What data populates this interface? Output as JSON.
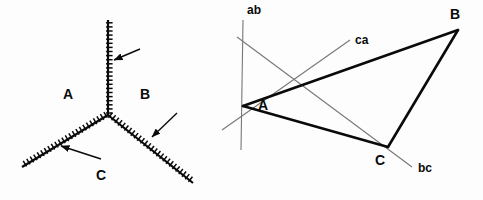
{
  "figure": {
    "background_color": "#fdfdfd",
    "ink_color": "#0a0a0a",
    "thin_line_color": "#777777",
    "width": 483,
    "height": 200
  },
  "left_panel": {
    "name": "triple-junction-grain-boundary-diagram",
    "junction": {
      "x": 108,
      "y": 115
    },
    "branches": [
      {
        "id": "branch-up",
        "label": "boundary-A-B",
        "x1": 108,
        "y1": 115,
        "x2": 108,
        "y2": 20,
        "hatch_side": 1
      },
      {
        "id": "branch-lower-left",
        "label": "boundary-A-C",
        "x1": 108,
        "y1": 115,
        "x2": 22,
        "y2": 167,
        "hatch_side": 1
      },
      {
        "id": "branch-lower-right",
        "label": "boundary-B-C",
        "x1": 108,
        "y1": 115,
        "x2": 193,
        "y2": 183,
        "hatch_side": -1
      }
    ],
    "arrows": [
      {
        "id": "arrow-to-branch-up",
        "x1": 140,
        "y1": 49,
        "x2": 114,
        "y2": 60
      },
      {
        "id": "arrow-to-branch-lower-right",
        "x1": 177,
        "y1": 113,
        "x2": 152,
        "y2": 137
      },
      {
        "id": "arrow-to-branch-lower-left",
        "x1": 101,
        "y1": 159,
        "x2": 61,
        "y2": 146
      }
    ],
    "region_labels": [
      {
        "id": "region-a",
        "text": "A",
        "x": 63,
        "y": 87
      },
      {
        "id": "region-b",
        "text": "B",
        "x": 140,
        "y": 87
      },
      {
        "id": "region-c",
        "text": "C",
        "x": 96,
        "y": 168
      }
    ]
  },
  "right_panel": {
    "name": "triangle-with-boundary-trace-lines-diagram",
    "vertices": [
      {
        "id": "vertex-a",
        "text": "A",
        "x": 243,
        "y": 106,
        "label_x": 258,
        "label_y": 98
      },
      {
        "id": "vertex-b",
        "text": "B",
        "x": 458,
        "y": 30,
        "label_x": 450,
        "label_y": 7
      },
      {
        "id": "vertex-c",
        "text": "C",
        "x": 388,
        "y": 147,
        "label_x": 375,
        "label_y": 153
      }
    ],
    "triangle_edges": [
      {
        "id": "edge-ab",
        "from": "A",
        "to": "B"
      },
      {
        "id": "edge-bc",
        "from": "B",
        "to": "C"
      },
      {
        "id": "edge-ca",
        "from": "C",
        "to": "A"
      }
    ],
    "trace_lines": [
      {
        "id": "trace-ab",
        "text": "ab",
        "x1": 243,
        "y1": 20,
        "x2": 241,
        "y2": 150,
        "label_x": 247,
        "label_y": 4
      },
      {
        "id": "trace-ca",
        "text": "ca",
        "x1": 222,
        "y1": 130,
        "x2": 350,
        "y2": 40,
        "label_x": 355,
        "label_y": 34
      },
      {
        "id": "trace-bc",
        "text": "bc",
        "x1": 237,
        "y1": 37,
        "x2": 412,
        "y2": 167,
        "label_x": 418,
        "label_y": 162
      }
    ]
  }
}
